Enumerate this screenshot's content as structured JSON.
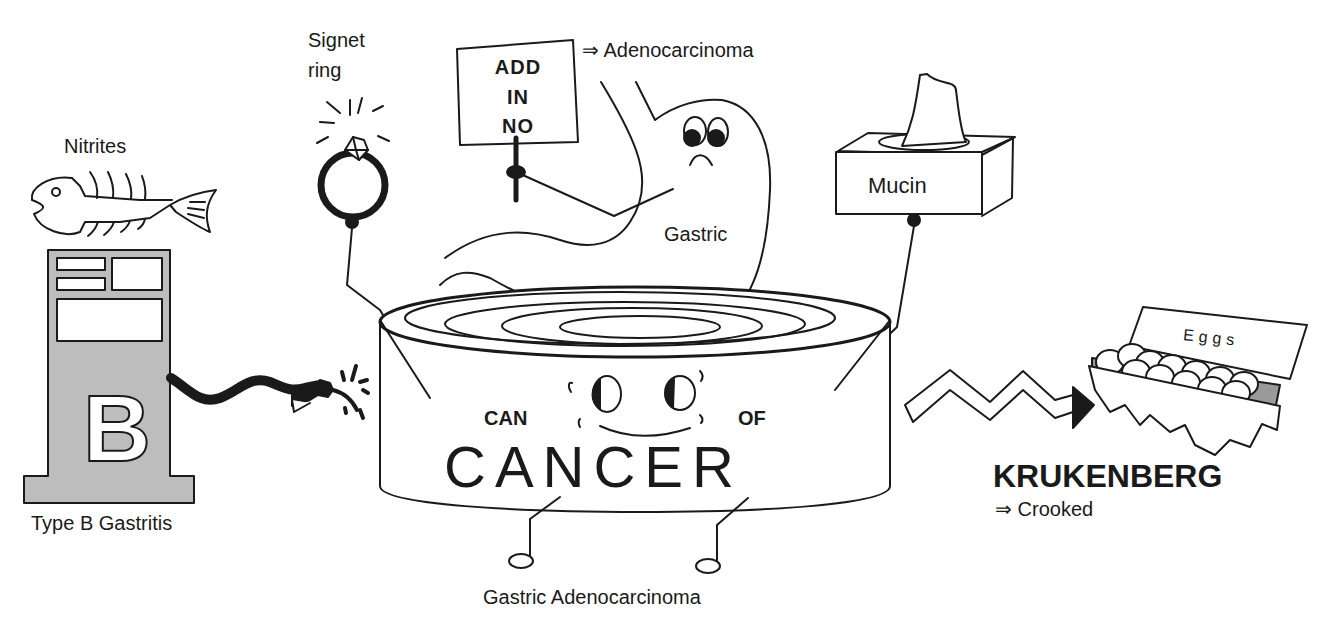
{
  "labels": {
    "nitrites": "Nitrites",
    "signet_ring": [
      "Signet",
      "ring"
    ],
    "sign_text": [
      "ADD",
      "IN",
      "NO"
    ],
    "adenocarcinoma_arrow": "⇒ Adenocarcinoma",
    "gastric": "Gastric",
    "mucin": "Mucin",
    "eggs": "Eggs",
    "pump_letter": "B",
    "type_b_gastritis": "Type B Gastritis",
    "can": "CAN",
    "of": "OF",
    "cancer": "CANCER",
    "krukenberg": "KRUKENBERG",
    "crooked_arrow": "⇒ Crooked",
    "caption": "Gastric Adenocarcinoma"
  },
  "colors": {
    "ink": "#1a1a1a",
    "pump_gray": "#bdbdbd",
    "paper": "#ffffff",
    "carton_shadow": "#9a9a9a"
  }
}
